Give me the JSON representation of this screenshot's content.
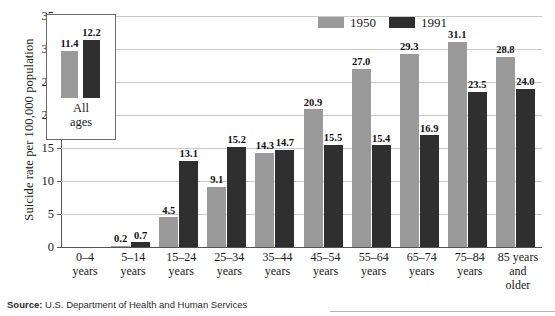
{
  "chart_data": {
    "type": "bar",
    "title": "",
    "xlabel": "",
    "ylabel": "Suicide rate per 100,000 population",
    "ylim": [
      0,
      35
    ],
    "yticks": [
      0,
      5,
      10,
      15,
      20,
      25,
      30,
      35
    ],
    "grid": true,
    "legend_position": "top-right",
    "categories": [
      "0–4 years",
      "5–14 years",
      "15–24 years",
      "25–34 years",
      "35–44 years",
      "45–54 years",
      "55–64 years",
      "65–74 years",
      "75–84 years",
      "85 years and older"
    ],
    "series": [
      {
        "name": "1950",
        "color": "#9a9a9a",
        "values": [
          0,
          0.2,
          4.5,
          9.1,
          14.3,
          20.9,
          27.0,
          29.3,
          31.1,
          28.8
        ]
      },
      {
        "name": "1991",
        "color": "#2f2f2f",
        "values": [
          0,
          0.7,
          13.1,
          15.2,
          14.7,
          15.5,
          15.4,
          16.9,
          23.5,
          24.0
        ]
      }
    ],
    "inset": {
      "caption_lines": [
        "All",
        "ages"
      ],
      "series": [
        {
          "name": "1950",
          "value": 11.4
        },
        {
          "name": "1991",
          "value": 12.2
        }
      ]
    }
  },
  "axis": {
    "y_title": "Suicide rate per 100,000 population",
    "y_tick_labels": [
      "0",
      "5",
      "10",
      "15",
      "20",
      "25",
      "30",
      "35"
    ]
  },
  "legend": {
    "entries": [
      {
        "label": "1950",
        "color": "#9a9a9a"
      },
      {
        "label": "1991",
        "color": "#2f2f2f"
      }
    ]
  },
  "category_labels": [
    {
      "lines": [
        "0–4",
        "years"
      ]
    },
    {
      "lines": [
        "5–14",
        "years"
      ]
    },
    {
      "lines": [
        "15–24",
        "years"
      ]
    },
    {
      "lines": [
        "25–34",
        "years"
      ]
    },
    {
      "lines": [
        "35–44",
        "years"
      ]
    },
    {
      "lines": [
        "45–54",
        "years"
      ]
    },
    {
      "lines": [
        "55–64",
        "years"
      ]
    },
    {
      "lines": [
        "65–74",
        "years"
      ]
    },
    {
      "lines": [
        "75–84",
        "years"
      ]
    },
    {
      "lines": [
        "85 years",
        "and",
        "older"
      ]
    }
  ],
  "bar_value_labels": {
    "g0": {
      "s1950": "",
      "s1991": ""
    },
    "g1": {
      "s1950": "0.2",
      "s1991": "0.7"
    },
    "g2": {
      "s1950": "4.5",
      "s1991": "13.1"
    },
    "g3": {
      "s1950": "9.1",
      "s1991": "15.2"
    },
    "g4": {
      "s1950": "14.3",
      "s1991": "14.7"
    },
    "g5": {
      "s1950": "20.9",
      "s1991": "15.5"
    },
    "g6": {
      "s1950": "27.0",
      "s1991": "15.4"
    },
    "g7": {
      "s1950": "29.3",
      "s1991": "16.9"
    },
    "g8": {
      "s1950": "31.1",
      "s1991": "23.5"
    },
    "g9": {
      "s1950": "28.8",
      "s1991": "24.0"
    }
  },
  "inset_box": {
    "value_1950": "11.4",
    "value_1991": "12.2",
    "caption_line1": "All",
    "caption_line2": "ages"
  },
  "source": {
    "label": "Source:",
    "text": "U.S. Department of Health and Human Services"
  }
}
